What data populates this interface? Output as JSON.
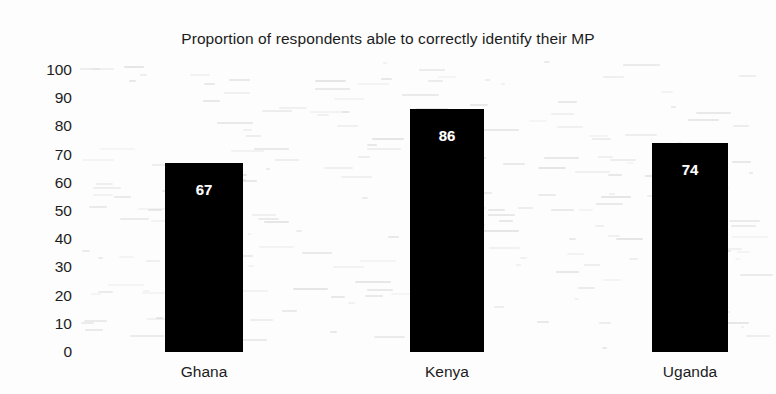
{
  "chart_data": {
    "type": "bar",
    "title": "Proportion of respondents able to correctly identify their MP",
    "xlabel": "",
    "ylabel": "",
    "categories": [
      "Ghana",
      "Kenya",
      "Uganda"
    ],
    "values": [
      67,
      74,
      86
    ],
    "series": [
      {
        "name": "Proportion able to correctly identify their MP",
        "values": [
          67,
          86,
          74
        ]
      }
    ],
    "data_labels": [
      "67",
      "86",
      "74"
    ],
    "ylim": [
      0,
      100
    ],
    "yticks": [
      100,
      90,
      80,
      70,
      60,
      50,
      40,
      30,
      20,
      10,
      0
    ],
    "ytick_labels": [
      "100",
      "90",
      "80",
      "70",
      "60",
      "50",
      "40",
      "30",
      "20",
      "10",
      "0"
    ],
    "grid": false,
    "legend": "none",
    "bar_color": "#000000",
    "label_color": "#ffffff",
    "text_color": "#1c1c1c",
    "background_color": "#fdfdfd",
    "bars": [
      {
        "category": "Ghana",
        "value": 67,
        "label": "67"
      },
      {
        "category": "Kenya",
        "value": 86,
        "label": "86"
      },
      {
        "category": "Uganda",
        "value": 74,
        "label": "74"
      }
    ]
  }
}
